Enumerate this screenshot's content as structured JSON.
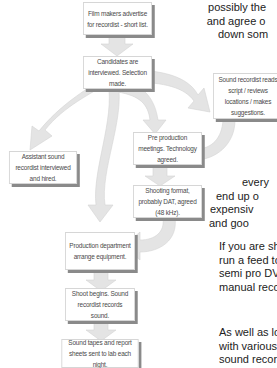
{
  "flowchart": {
    "boxes": [
      {
        "id": "advertise",
        "text": "Film makers advertise for recordist - short list."
      },
      {
        "id": "interview",
        "text": "Candidates are interviewed. Selection made."
      },
      {
        "id": "reads-script",
        "text": "Sound recordist reads script / reviews locations / makes suggestions."
      },
      {
        "id": "assistant",
        "text": "Assistant sound recordist interviewed and hired."
      },
      {
        "id": "preproduction",
        "text": "Pre production meetings. Technology agreed."
      },
      {
        "id": "format",
        "text": "Shooting format, probably DAT, agreed (48 kHz)."
      },
      {
        "id": "equipment",
        "text": "Production department arrange equipment."
      },
      {
        "id": "shoot",
        "text": "Shoot begins. Sound recordist records sound."
      },
      {
        "id": "tapes",
        "text": "Sound tapes and report sheets sent to lab each night."
      }
    ]
  },
  "body_text": {
    "top_lines": [
      "possibly the",
      "and agree o",
      "down som"
    ],
    "middle_lines": [
      "every",
      "end up o",
      "expensiv",
      "and goo"
    ],
    "para2_lines": [
      "If you are sh",
      "run a feed to",
      "semi pro DV",
      "manual reco"
    ],
    "para3_lines": [
      "As well as lo",
      "with various",
      "sound recor"
    ]
  },
  "colors": {
    "arrow_fill": "#e4e4e4",
    "box_shadow": "#8a8a8a",
    "box_text": "#4a4a4a"
  }
}
